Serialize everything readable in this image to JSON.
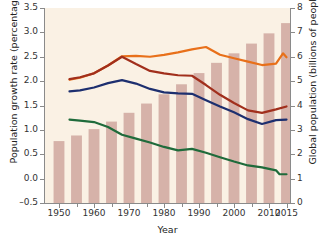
{
  "chart_data": {
    "type": "bar",
    "title": "",
    "subtitle": "",
    "xlabel": "Year",
    "ylabel": "Population growth rate (percentage)",
    "ylabel_right": "Global population (billions of people)",
    "xlim": [
      1946,
      2016
    ],
    "ylim": [
      -0.5,
      3.5
    ],
    "ylim_right": [
      0,
      8
    ],
    "grid": false,
    "legend": "none",
    "y_ticks": [
      "3.5",
      "3.0",
      "2.5",
      "2.0",
      "1.5",
      "1.0",
      "0.5",
      "0.0",
      "–0.5"
    ],
    "y_tick_values": [
      3.5,
      3.0,
      2.5,
      2.0,
      1.5,
      1.0,
      0.5,
      0.0,
      -0.5
    ],
    "y_ticks_right": [
      "8",
      "7",
      "6",
      "5",
      "4",
      "3",
      "2",
      "1",
      "0"
    ],
    "y_tick_values_right": [
      8,
      7,
      6,
      5,
      4,
      3,
      2,
      1,
      0
    ],
    "x_ticks": [
      "1950",
      "1960",
      "1970",
      "1980",
      "1990",
      "2000",
      "2010",
      "2015"
    ],
    "x_tick_values": [
      1950,
      1960,
      1970,
      1980,
      1990,
      2000,
      2010,
      2015
    ],
    "x_minor_ticks": [
      1955,
      1965,
      1975,
      1985,
      1995,
      2005
    ],
    "bars": {
      "name": "Global population",
      "axis": "right",
      "unit": "billions of people",
      "color": "#cfa79f",
      "x": [
        1950,
        1955,
        1960,
        1965,
        1970,
        1975,
        1980,
        1985,
        1990,
        1995,
        2000,
        2005,
        2010,
        2015
      ],
      "values": [
        2.54,
        2.77,
        3.03,
        3.34,
        3.7,
        4.08,
        4.46,
        4.87,
        5.33,
        5.75,
        6.14,
        6.54,
        6.96,
        7.38
      ]
    },
    "series": [
      {
        "name": "orange-line",
        "color": "#e8701a",
        "axis": "left",
        "unit": "percentage",
        "x": [
          1953,
          1956,
          1960,
          1964,
          1968,
          1972,
          1976,
          1980,
          1984,
          1988,
          1992,
          1996,
          2000,
          2004,
          2008,
          2012,
          2014,
          2015
        ],
        "values": [
          2.03,
          2.07,
          2.16,
          2.32,
          2.51,
          2.52,
          2.5,
          2.54,
          2.59,
          2.65,
          2.7,
          2.54,
          2.47,
          2.4,
          2.33,
          2.36,
          2.57,
          2.49
        ]
      },
      {
        "name": "dark-red-line",
        "color": "#a12f1c",
        "axis": "left",
        "unit": "percentage",
        "x": [
          1953,
          1956,
          1960,
          1964,
          1968,
          1972,
          1976,
          1980,
          1984,
          1988,
          1992,
          1996,
          2000,
          2004,
          2008,
          2012,
          2015
        ],
        "values": [
          2.04,
          2.08,
          2.16,
          2.32,
          2.5,
          2.35,
          2.21,
          2.16,
          2.12,
          2.11,
          1.92,
          1.72,
          1.55,
          1.4,
          1.35,
          1.42,
          1.48
        ]
      },
      {
        "name": "navy-blue-line",
        "color": "#1d2f6f",
        "axis": "left",
        "unit": "percentage",
        "x": [
          1953,
          1956,
          1960,
          1964,
          1968,
          1972,
          1976,
          1980,
          1984,
          1988,
          1992,
          1996,
          2000,
          2004,
          2008,
          2012,
          2015
        ],
        "values": [
          1.79,
          1.81,
          1.87,
          1.96,
          2.02,
          1.95,
          1.84,
          1.77,
          1.75,
          1.74,
          1.61,
          1.48,
          1.36,
          1.22,
          1.12,
          1.2,
          1.21
        ]
      },
      {
        "name": "green-line",
        "color": "#1f6b3b",
        "axis": "left",
        "unit": "percentage",
        "x": [
          1953,
          1956,
          1960,
          1964,
          1968,
          1972,
          1976,
          1980,
          1984,
          1988,
          1992,
          1996,
          2000,
          2004,
          2008,
          2012,
          2013,
          2015
        ],
        "values": [
          1.21,
          1.19,
          1.16,
          1.06,
          0.9,
          0.82,
          0.74,
          0.65,
          0.58,
          0.61,
          0.53,
          0.44,
          0.35,
          0.27,
          0.23,
          0.17,
          0.09,
          0.09
        ]
      }
    ]
  },
  "axes": {
    "left_title": "Population growth rate (percentage)",
    "right_title": "Global population (billions of people)",
    "x_title": "Year"
  }
}
